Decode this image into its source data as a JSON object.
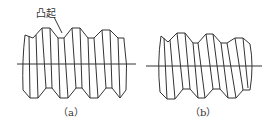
{
  "diagram": {
    "type": "screw-thread-profiles",
    "figures": [
      {
        "id": "a",
        "caption": "（a）",
        "callout": "凸起",
        "thread_crests": 5,
        "has_protrusion": true
      },
      {
        "id": "b",
        "caption": "（b）",
        "thread_crests": 5,
        "has_protrusion": false
      }
    ],
    "colors": {
      "line": "#333333",
      "background": "#ffffff"
    }
  }
}
